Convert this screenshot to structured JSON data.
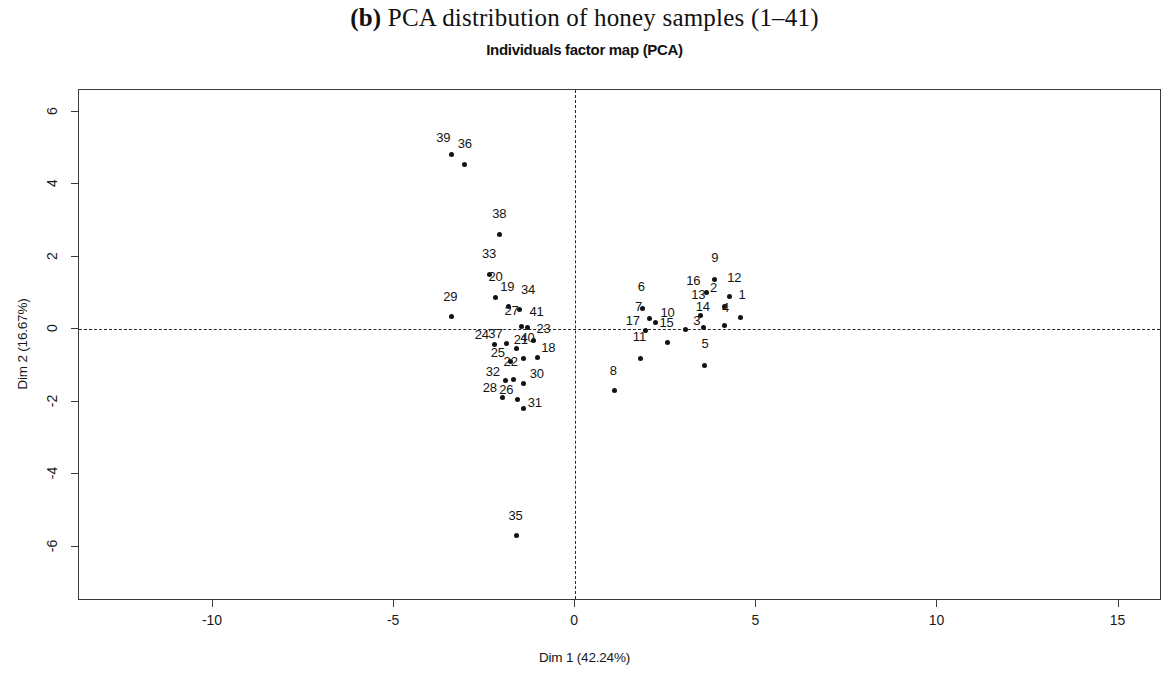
{
  "figure": {
    "panel_label": "(b)",
    "main_title": " PCA distribution of honey samples (1–41)",
    "sub_title": "Individuals factor map (PCA)"
  },
  "chart_data": {
    "type": "scatter",
    "title": "Individuals factor map (PCA)",
    "xlabel": "Dim 1 (42.24%)",
    "ylabel": "Dim 2 (16.67%)",
    "xlim": [
      -13.7,
      16.2
    ],
    "ylim": [
      -7.5,
      6.6
    ],
    "xticks": [
      -10,
      -5,
      0,
      5,
      10,
      15
    ],
    "yticks": [
      -6,
      -4,
      -2,
      0,
      2,
      4,
      6
    ],
    "grid": false,
    "legend": null,
    "reference_lines": {
      "horizontal": 0,
      "vertical": 0,
      "style": "dashed"
    },
    "point_color": "#121212",
    "points": [
      {
        "label": "1",
        "x": 4.55,
        "y": 0.32
      },
      {
        "label": "2",
        "x": 4.12,
        "y": 0.62
      },
      {
        "label": "3",
        "x": 3.05,
        "y": -0.02
      },
      {
        "label": "4",
        "x": 4.12,
        "y": 0.09
      },
      {
        "label": "5",
        "x": 3.58,
        "y": -1.0
      },
      {
        "label": "6",
        "x": 1.85,
        "y": 0.56
      },
      {
        "label": "7",
        "x": 2.05,
        "y": 0.3
      },
      {
        "label": "8",
        "x": 1.08,
        "y": -1.7
      },
      {
        "label": "9",
        "x": 3.85,
        "y": 1.38
      },
      {
        "label": "10",
        "x": 2.22,
        "y": 0.18
      },
      {
        "label": "11",
        "x": 1.8,
        "y": -0.8
      },
      {
        "label": "12",
        "x": 4.25,
        "y": 0.9
      },
      {
        "label": "13",
        "x": 3.45,
        "y": 0.38
      },
      {
        "label": "14",
        "x": 3.55,
        "y": 0.06
      },
      {
        "label": "15",
        "x": 2.55,
        "y": -0.38
      },
      {
        "label": "16",
        "x": 3.62,
        "y": 1.02
      },
      {
        "label": "17",
        "x": 1.95,
        "y": -0.04
      },
      {
        "label": "18",
        "x": -1.05,
        "y": -0.78
      },
      {
        "label": "19",
        "x": -1.85,
        "y": 0.62
      },
      {
        "label": "20",
        "x": -2.2,
        "y": 0.88
      },
      {
        "label": "21",
        "x": -1.42,
        "y": -0.82
      },
      {
        "label": "22",
        "x": -1.7,
        "y": -1.4
      },
      {
        "label": "23",
        "x": -1.15,
        "y": -0.3
      },
      {
        "label": "24",
        "x": -2.22,
        "y": -0.42
      },
      {
        "label": "25",
        "x": -1.78,
        "y": -0.9
      },
      {
        "label": "26",
        "x": -1.6,
        "y": -1.95
      },
      {
        "label": "27",
        "x": -1.48,
        "y": 0.08
      },
      {
        "label": "28",
        "x": -2.0,
        "y": -1.88
      },
      {
        "label": "29",
        "x": -3.42,
        "y": 0.35
      },
      {
        "label": "30",
        "x": -1.42,
        "y": -1.5
      },
      {
        "label": "31",
        "x": -1.42,
        "y": -2.18
      },
      {
        "label": "32",
        "x": -1.92,
        "y": -1.42
      },
      {
        "label": "33",
        "x": -2.38,
        "y": 1.52
      },
      {
        "label": "34",
        "x": -1.55,
        "y": 0.55
      },
      {
        "label": "35",
        "x": -1.62,
        "y": -5.7
      },
      {
        "label": "36",
        "x": -3.05,
        "y": 4.55
      },
      {
        "label": "37",
        "x": -1.9,
        "y": -0.4
      },
      {
        "label": "38",
        "x": -2.1,
        "y": 2.62
      },
      {
        "label": "39",
        "x": -3.42,
        "y": 4.82
      },
      {
        "label": "40",
        "x": -1.62,
        "y": -0.52
      },
      {
        "label": "41",
        "x": -1.32,
        "y": 0.05
      }
    ],
    "label_offsets": {
      "1": {
        "dx": 2,
        "dy": -16
      },
      "2": {
        "dx": -11,
        "dy": -12
      },
      "3": {
        "dx": 11,
        "dy": -2
      },
      "4": {
        "dx": 1,
        "dy": -11
      },
      "5": {
        "dx": 0,
        "dy": -14
      },
      "6": {
        "dx": -1,
        "dy": -15
      },
      "7": {
        "dx": -11,
        "dy": -4
      },
      "8": {
        "dx": -1,
        "dy": -13
      },
      "9": {
        "dx": 0,
        "dy": -14
      },
      "10": {
        "dx": 12,
        "dy": -3
      },
      "11": {
        "dx": -1,
        "dy": -14
      },
      "12": {
        "dx": 5,
        "dy": -12
      },
      "13": {
        "dx": -2,
        "dy": -13
      },
      "14": {
        "dx": -1,
        "dy": -13
      },
      "15": {
        "dx": -1,
        "dy": -13
      },
      "16": {
        "dx": -13,
        "dy": -4
      },
      "17": {
        "dx": -13,
        "dy": -3
      },
      "18": {
        "dx": 11,
        "dy": -2
      },
      "19": {
        "dx": -1,
        "dy": -13
      },
      "20": {
        "dx": 0,
        "dy": -13
      },
      "21": {
        "dx": -3,
        "dy": -12
      },
      "22": {
        "dx": -3,
        "dy": -11
      },
      "23": {
        "dx": 10,
        "dy": -4
      },
      "24": {
        "dx": -13,
        "dy": -2
      },
      "25": {
        "dx": -13,
        "dy": -2
      },
      "26": {
        "dx": -11,
        "dy": -3
      },
      "27": {
        "dx": -10,
        "dy": -8
      },
      "28": {
        "dx": -13,
        "dy": -2
      },
      "29": {
        "dx": -1,
        "dy": -13
      },
      "30": {
        "dx": 13,
        "dy": -3
      },
      "31": {
        "dx": 11,
        "dy": 2
      },
      "32": {
        "dx": -13,
        "dy": -2
      },
      "33": {
        "dx": 0,
        "dy": -13
      },
      "34": {
        "dx": 9,
        "dy": -12
      },
      "35": {
        "dx": -1,
        "dy": -13
      },
      "36": {
        "dx": 0,
        "dy": -13
      },
      "37": {
        "dx": -11,
        "dy": -3
      },
      "38": {
        "dx": 0,
        "dy": -13
      },
      "39": {
        "dx": -8,
        "dy": -10
      },
      "40": {
        "dx": 11,
        "dy": -3
      },
      "41": {
        "dx": 9,
        "dy": -8
      }
    }
  }
}
